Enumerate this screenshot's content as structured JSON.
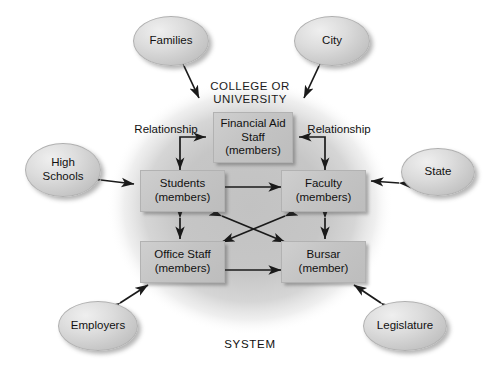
{
  "diagram": {
    "title_caps": "COLLEGE OR\nUNIVERSITY",
    "title_line1": "COLLEGE OR",
    "title_line2": "UNIVERSITY",
    "system_label": "SYSTEM",
    "relationship_left": "Relationship",
    "relationship_right": "Relationship",
    "colors": {
      "node_fill": "#c6c6c6",
      "ellipse_fill": "#d8d8d8",
      "system_blob": "#c9c9c9",
      "arrow": "#1a1a1a",
      "text": "#111111",
      "background": "#ffffff"
    },
    "inner_nodes": [
      {
        "id": "financial-aid-staff",
        "line1": "Financial Aid",
        "line2": "Staff",
        "line3": "(members)"
      },
      {
        "id": "students",
        "line1": "Students",
        "line2": "(members)",
        "line3": ""
      },
      {
        "id": "faculty",
        "line1": "Faculty",
        "line2": "(members)",
        "line3": ""
      },
      {
        "id": "office-staff",
        "line1": "Office Staff",
        "line2": "(members)",
        "line3": ""
      },
      {
        "id": "bursar",
        "line1": "Bursar",
        "line2": "(member)",
        "line3": ""
      }
    ],
    "outer_nodes": [
      {
        "id": "families",
        "line1": "Families",
        "line2": ""
      },
      {
        "id": "city",
        "line1": "City",
        "line2": ""
      },
      {
        "id": "high-schools",
        "line1": "High",
        "line2": "Schools"
      },
      {
        "id": "state",
        "line1": "State",
        "line2": ""
      },
      {
        "id": "employers",
        "line1": "Employers",
        "line2": ""
      },
      {
        "id": "legislature",
        "line1": "Legislature",
        "line2": ""
      }
    ]
  }
}
